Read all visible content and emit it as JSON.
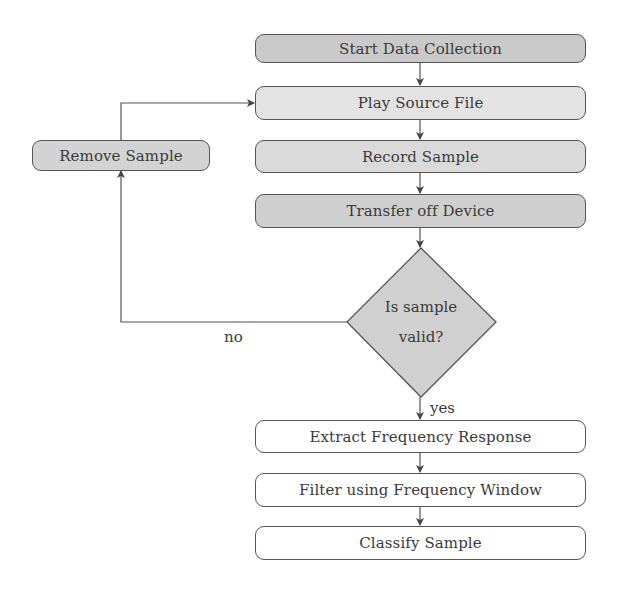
{
  "diagram": {
    "type": "flowchart",
    "nodes": {
      "start": {
        "label": "Start Data Collection",
        "fill": "#c9c9c9"
      },
      "play": {
        "label": "Play Source File",
        "fill": "#e3e3e3"
      },
      "record": {
        "label": "Record Sample",
        "fill": "#dadada"
      },
      "transfer": {
        "label": "Transfer off Device",
        "fill": "#cfcfcf"
      },
      "remove": {
        "label": "Remove Sample",
        "fill": "#d3d3d3"
      },
      "decision": {
        "line1": "Is sample",
        "line2": "valid?",
        "fill": "#d0d0d0"
      },
      "extract": {
        "label": "Extract Frequency Response",
        "fill": "#ffffff"
      },
      "filter": {
        "label": "Filter using Frequency Window",
        "fill": "#ffffff"
      },
      "classify": {
        "label": "Classify Sample",
        "fill": "#ffffff"
      }
    },
    "edge_labels": {
      "no": "no",
      "yes": "yes"
    },
    "edges": [
      [
        "start",
        "play"
      ],
      [
        "play",
        "record"
      ],
      [
        "record",
        "transfer"
      ],
      [
        "transfer",
        "decision"
      ],
      [
        "decision",
        "remove",
        "no"
      ],
      [
        "remove",
        "play"
      ],
      [
        "decision",
        "extract",
        "yes"
      ],
      [
        "extract",
        "filter"
      ],
      [
        "filter",
        "classify"
      ]
    ]
  }
}
